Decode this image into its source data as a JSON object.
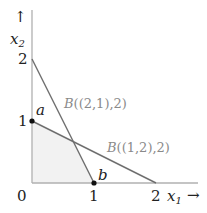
{
  "axes": {
    "x_label": "x",
    "x_label_sub": "1",
    "y_label": "x",
    "y_label_sub": "2",
    "x_arrow": "→",
    "y_arrow": "↑",
    "x_ticks": [
      "0",
      "1",
      "2"
    ],
    "y_ticks": [
      "1",
      "2"
    ]
  },
  "lines": [
    {
      "label_prefix": "B",
      "label_rest": "((2,1),2)",
      "from": [
        0,
        2
      ],
      "to": [
        1,
        0
      ]
    },
    {
      "label_prefix": "B",
      "label_rest": "((1,2),2)",
      "from": [
        0,
        1
      ],
      "to": [
        2,
        0
      ]
    }
  ],
  "points": [
    {
      "name": "a",
      "x": 0,
      "y": 1
    },
    {
      "name": "b",
      "x": 1,
      "y": 0
    }
  ],
  "region": {
    "vertices": [
      [
        0,
        0
      ],
      [
        0,
        1
      ],
      [
        0.6667,
        0.6667
      ],
      [
        1,
        0
      ]
    ],
    "fill": "#f2f2f2"
  },
  "colors": {
    "axis": "#b0b0b0",
    "line": "#6e6e6e",
    "label": "#8a8a8a",
    "text": "#222222"
  }
}
